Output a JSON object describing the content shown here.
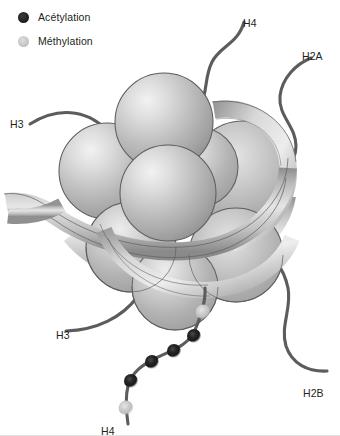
{
  "figure": {
    "type": "biological-diagram",
    "background_color": "#ffffff"
  },
  "legend": {
    "items": [
      {
        "icon": "filled-circle-icon",
        "label": "Acétylation",
        "color": "#1f1f1f",
        "marker": "dark-circle"
      },
      {
        "icon": "filled-circle-icon",
        "label": "Méthylation",
        "color": "#c8c8c8",
        "marker": "light-gray-circle"
      }
    ]
  },
  "tails": [
    {
      "id": "h3-upper-left",
      "label": "H3",
      "x": 10,
      "y": 118
    },
    {
      "id": "h4-top",
      "label": "H4",
      "x": 243,
      "y": 17
    },
    {
      "id": "h2a-right",
      "label": "H2A",
      "x": 302,
      "y": 50
    },
    {
      "id": "h3-lower-left",
      "label": "H3",
      "x": 56,
      "y": 329
    },
    {
      "id": "h2b-lower-right",
      "label": "H2B",
      "x": 303,
      "y": 387
    },
    {
      "id": "h4-bottom",
      "label": "H4",
      "x": 101,
      "y": 425
    }
  ],
  "modifications": {
    "chain_tail": "h4-bottom",
    "marks": [
      {
        "type": "Méthylation",
        "cx": 203,
        "cy": 312,
        "r": 6.0,
        "color": "#c9c9c9"
      },
      {
        "type": "Acétylation",
        "cx": 194,
        "cy": 336,
        "r": 5.6,
        "color": "#1f1f1f"
      },
      {
        "type": "Acétylation",
        "cx": 174,
        "cy": 351,
        "r": 5.6,
        "color": "#1f1f1f"
      },
      {
        "type": "Acétylation",
        "cx": 152,
        "cy": 362,
        "r": 5.6,
        "color": "#1f1f1f"
      },
      {
        "type": "Acétylation",
        "cx": 131,
        "cy": 381,
        "r": 5.6,
        "color": "#1f1f1f"
      },
      {
        "type": "Méthylation",
        "cx": 126,
        "cy": 408,
        "r": 6.0,
        "color": "#c9c9c9"
      }
    ]
  },
  "core": {
    "name": "histone-octamer",
    "sphere_count": 8,
    "sphere_fill_light": "#ebebeb",
    "sphere_fill_mid": "#b4b4b4",
    "sphere_fill_dark": "#949494",
    "sphere_stroke": "#5a5a5a",
    "dna_ribbon_color": "#bdbdbd",
    "dna_ribbon_stroke": "#5f5f5f",
    "tail_stroke": "#5c5c5c"
  }
}
